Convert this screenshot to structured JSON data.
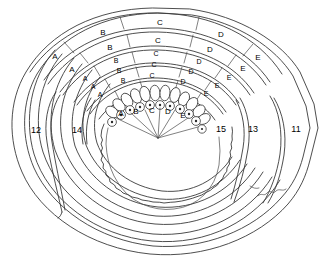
{
  "figure": {
    "background_color": "#ffffff",
    "line_color": "#3a3a3a",
    "text_color": "#000000"
  },
  "zone_labels": {
    "A": "A",
    "B": "B",
    "C": "C",
    "D": "D",
    "E": "E"
  },
  "rings": [
    {
      "index": 1,
      "name": "outermost-ring",
      "segments": [
        {
          "label": "A",
          "x": 55,
          "y": 57
        },
        {
          "label": "B",
          "x": 103,
          "y": 33
        },
        {
          "label": "C",
          "x": 160,
          "y": 23
        },
        {
          "label": "D",
          "x": 221,
          "y": 35
        },
        {
          "label": "E",
          "x": 258,
          "y": 58
        }
      ]
    },
    {
      "index": 2,
      "name": "ring-2",
      "segments": [
        {
          "label": "A",
          "x": 72,
          "y": 70
        },
        {
          "label": "B",
          "x": 110,
          "y": 48
        },
        {
          "label": "C",
          "x": 158,
          "y": 41
        },
        {
          "label": "D",
          "x": 210,
          "y": 50
        },
        {
          "label": "E",
          "x": 243,
          "y": 69
        }
      ]
    },
    {
      "index": 3,
      "name": "ring-3",
      "segments": [
        {
          "label": "A",
          "x": 85,
          "y": 79
        },
        {
          "label": "B",
          "x": 116,
          "y": 61
        },
        {
          "label": "C",
          "x": 156,
          "y": 54
        },
        {
          "label": "D",
          "x": 199,
          "y": 62
        },
        {
          "label": "E",
          "x": 229,
          "y": 78
        }
      ]
    },
    {
      "index": 4,
      "name": "ring-4",
      "segments": [
        {
          "label": "A",
          "x": 93,
          "y": 87
        },
        {
          "label": "B",
          "x": 119,
          "y": 71
        },
        {
          "label": "C",
          "x": 154,
          "y": 65
        },
        {
          "label": "D",
          "x": 191,
          "y": 72
        },
        {
          "label": "E",
          "x": 217,
          "y": 86
        }
      ]
    },
    {
      "index": 5,
      "name": "ring-5",
      "segments": [
        {
          "label": "A",
          "x": 100,
          "y": 95
        },
        {
          "label": "B",
          "x": 123,
          "y": 81
        },
        {
          "label": "C",
          "x": 152,
          "y": 76
        },
        {
          "label": "D",
          "x": 183,
          "y": 82
        },
        {
          "label": "E",
          "x": 206,
          "y": 94
        }
      ]
    },
    {
      "index": 6,
      "name": "innermost-cell-ring",
      "segments": [
        {
          "label": "A",
          "x": 121,
          "y": 114
        },
        {
          "label": "B",
          "x": 136,
          "y": 112
        },
        {
          "label": "C",
          "x": 152,
          "y": 111
        },
        {
          "label": "D",
          "x": 168,
          "y": 112
        },
        {
          "label": "E",
          "x": 183,
          "y": 116
        }
      ]
    }
  ],
  "region_numbers": [
    {
      "value": "12",
      "x": 36,
      "y": 131,
      "name": "region-number-12"
    },
    {
      "value": "14",
      "x": 77,
      "y": 131,
      "name": "region-number-14"
    },
    {
      "value": "15",
      "x": 221,
      "y": 130,
      "name": "region-number-15"
    },
    {
      "value": "13",
      "x": 253,
      "y": 130,
      "name": "region-number-13"
    },
    {
      "value": "11",
      "x": 296,
      "y": 130,
      "name": "region-number-11"
    }
  ]
}
